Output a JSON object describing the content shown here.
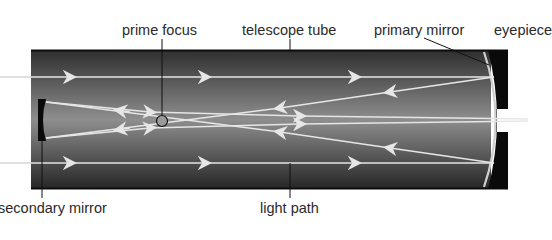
{
  "diagram": {
    "labels": {
      "prime_focus": "prime focus",
      "telescope_tube": "telescope tube",
      "primary_mirror": "primary mirror",
      "eyepiece": "eyepiece",
      "secondary_mirror": "secondary mirror",
      "light_path": "light path"
    },
    "colors": {
      "tube_dark": "#2b2b2b",
      "tube_mid": "#8a8a8a",
      "ray": "#e6e6e6",
      "mirror": "#cfcfcf",
      "cap": "#0a0a0a",
      "text": "#2a2a2a"
    }
  }
}
